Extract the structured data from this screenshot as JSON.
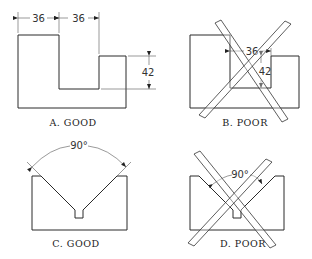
{
  "figure": {
    "panels": [
      {
        "id": "A",
        "caption": "A.  GOOD",
        "dims": [
          "36",
          "36",
          "42"
        ]
      },
      {
        "id": "B",
        "caption": "B.  POOR",
        "dims": [
          "36",
          "42"
        ]
      },
      {
        "id": "C",
        "caption": "C.  GOOD",
        "dims": [
          "90°"
        ]
      },
      {
        "id": "D",
        "caption": "D.  POOR",
        "dims": [
          "90°"
        ]
      }
    ]
  }
}
